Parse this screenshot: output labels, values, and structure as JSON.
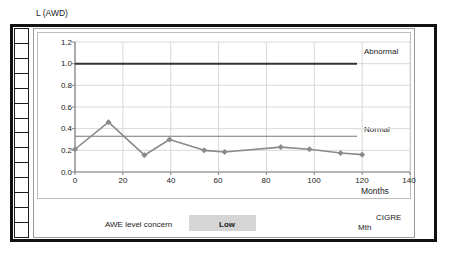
{
  "chart_data": {
    "type": "line",
    "title": "L (AWD)",
    "xlabel": "Months",
    "ylabel": "L (AWD)",
    "xlim": [
      0,
      140
    ],
    "ylim": [
      0.0,
      1.2
    ],
    "xticks": [
      0,
      20,
      40,
      60,
      80,
      100,
      120,
      140
    ],
    "yticks": [
      "0.0",
      "0.2",
      "0.4",
      "0.6",
      "0.8",
      "1.0",
      "1.2"
    ],
    "grid": true,
    "legend_position": "inline-right",
    "x": [
      0,
      14,
      29,
      39.5,
      54,
      62.5,
      86,
      98,
      111,
      120
    ],
    "values": [
      0.21,
      0.46,
      0.155,
      0.3,
      0.2,
      0.185,
      0.23,
      0.21,
      0.175,
      0.16
    ],
    "series": [
      {
        "name": "L (AWD)",
        "x": [
          0,
          14,
          29,
          39.5,
          54,
          62.5,
          86,
          98,
          111,
          120
        ],
        "values": [
          0.21,
          0.46,
          0.155,
          0.3,
          0.2,
          0.185,
          0.23,
          0.21,
          0.175,
          0.16
        ],
        "color": "#8a8a8a",
        "marker": "diamond"
      }
    ],
    "thresholds": [
      {
        "name": "Abnormal",
        "value": 1.0,
        "color": "#333333",
        "label": "Abnormal"
      },
      {
        "name": "Normal",
        "value": 0.33,
        "color": "#777777",
        "label": "Normal"
      }
    ],
    "annotations": [
      "Abnormal",
      "Normal",
      "Months"
    ]
  },
  "chart": {
    "title": "L (AWD)",
    "x_axis_label": "Months",
    "abnormal_label": "Abnormal",
    "normal_label": "Normal"
  },
  "footer": {
    "concern_label": "AWE level concern",
    "concern_value": "Low",
    "mth_label": "Mth",
    "org_label": "CIGRE"
  },
  "colors": {
    "series": "#8a8a8a",
    "abnormal_line": "#333333",
    "normal_line": "#777777",
    "grid": "#d9d9d9",
    "axis": "#808080",
    "swatch": "#d5d5d5",
    "frame": "#111111"
  }
}
